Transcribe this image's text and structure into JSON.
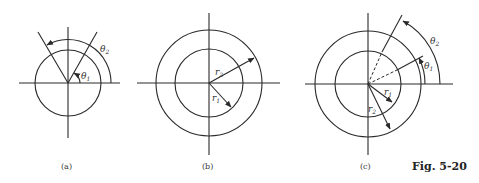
{
  "figure": {
    "caption": "Fig. 5-20",
    "panels": [
      {
        "id": "a",
        "label": "(a)",
        "description": "Circle with two rays from center; angles θ1 and θ2 measured from horizontal axis",
        "symbols": {
          "theta1": "θ",
          "theta1_sub": "1",
          "theta2": "θ",
          "theta2_sub": "2"
        }
      },
      {
        "id": "b",
        "label": "(b)",
        "description": "Two concentric circles with radii r1 and r2",
        "symbols": {
          "r1": "r",
          "r1_sub": "1",
          "r2": "r",
          "r2_sub": "2"
        }
      },
      {
        "id": "c",
        "label": "(c)",
        "description": "Annular sector bounded by radii r1, r2 and angles θ1, θ2",
        "symbols": {
          "r1": "r",
          "r1_sub": "1",
          "r2": "r",
          "r2_sub": "2",
          "theta1": "θ",
          "theta1_sub": "1",
          "theta2": "θ",
          "theta2_sub": "2"
        }
      }
    ]
  }
}
